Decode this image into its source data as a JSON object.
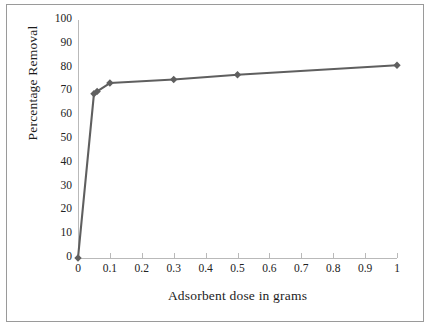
{
  "figure": {
    "background_color": "#ffffff",
    "frame_color": "#9a9a9a",
    "series_color": "#5f5f5f",
    "axis_color": "#b9b9b9"
  },
  "chart_data": {
    "type": "line",
    "title": "",
    "xlabel": "Adsorbent dose in grams",
    "ylabel": "Percentage Removal",
    "xlim": [
      0,
      1
    ],
    "ylim": [
      0,
      100
    ],
    "grid": false,
    "legend": "none",
    "marker": "diamond",
    "xticks": [
      "0",
      "0.1",
      "0.2",
      "0.3",
      "0.4",
      "0.5",
      "0.6",
      "0.7",
      "0.8",
      "0.9",
      "1"
    ],
    "xtick_values": [
      0,
      0.1,
      0.2,
      0.3,
      0.4,
      0.5,
      0.6,
      0.7,
      0.8,
      0.9,
      1
    ],
    "yticks": [
      "0",
      "10",
      "20",
      "30",
      "40",
      "50",
      "60",
      "70",
      "80",
      "90",
      "100"
    ],
    "ytick_values": [
      0,
      10,
      20,
      30,
      40,
      50,
      60,
      70,
      80,
      90,
      100
    ],
    "x": [
      0,
      0.05,
      0.06,
      0.1,
      0.3,
      0.5,
      1
    ],
    "values": [
      0,
      69,
      70,
      73.5,
      75,
      77,
      81
    ],
    "series": [
      {
        "name": "Percentage Removal",
        "x": [
          0,
          0.05,
          0.06,
          0.1,
          0.3,
          0.5,
          1
        ],
        "values": [
          0,
          69,
          70,
          73.5,
          75,
          77,
          81
        ]
      }
    ]
  }
}
